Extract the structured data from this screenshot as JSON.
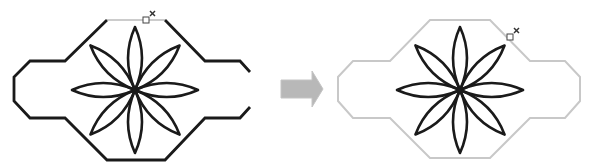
{
  "diagram": {
    "colors": {
      "outline_before": "#1a1a1a",
      "outline_after": "#c8c8c8",
      "flower": "#1a1a1a",
      "arrow": "#b4b4b4",
      "handle": "#555555"
    },
    "panels": [
      {
        "name": "before",
        "outline_state": "selected-dark"
      },
      {
        "name": "after",
        "outline_state": "light-gray"
      }
    ],
    "arrow": {
      "direction": "right"
    }
  }
}
